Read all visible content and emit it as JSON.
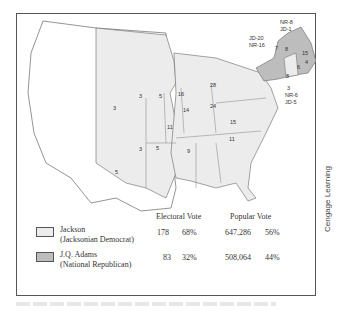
{
  "map": {
    "colors": {
      "jackson": "#ececec",
      "adams": "#bdbdbd",
      "territory": "#ffffff",
      "border": "#666666"
    },
    "state_labels": [
      {
        "text": "3",
        "x": 139,
        "y": 98
      },
      {
        "text": "5",
        "x": 159,
        "y": 98
      },
      {
        "text": "16",
        "x": 178,
        "y": 96
      },
      {
        "text": "28",
        "x": 210,
        "y": 87
      },
      {
        "text": "3",
        "x": 113,
        "y": 110
      },
      {
        "text": "14",
        "x": 183,
        "y": 112
      },
      {
        "text": "24",
        "x": 210,
        "y": 108
      },
      {
        "text": "15",
        "x": 230,
        "y": 124
      },
      {
        "text": "11",
        "x": 167,
        "y": 129
      },
      {
        "text": "11",
        "x": 229,
        "y": 141
      },
      {
        "text": "3",
        "x": 139,
        "y": 151
      },
      {
        "text": "5",
        "x": 156,
        "y": 150
      },
      {
        "text": "9",
        "x": 187,
        "y": 153
      },
      {
        "text": "5",
        "x": 115,
        "y": 174
      },
      {
        "text": "7",
        "x": 275,
        "y": 50
      },
      {
        "text": "8",
        "x": 285,
        "y": 51
      }
    ],
    "callouts": [
      {
        "text": "NR-8",
        "x": 280,
        "y": 24
      },
      {
        "text": "JD-1",
        "x": 280,
        "y": 31
      },
      {
        "text": "JD-20",
        "x": 249,
        "y": 40
      },
      {
        "text": "NR-16",
        "x": 249,
        "y": 47
      },
      {
        "text": "15",
        "x": 302,
        "y": 55
      },
      {
        "text": "4",
        "x": 305,
        "y": 64
      },
      {
        "text": "6",
        "x": 297,
        "y": 69
      },
      {
        "text": "8",
        "x": 286,
        "y": 78
      },
      {
        "text": "3",
        "x": 287,
        "y": 90
      },
      {
        "text": "NR-6",
        "x": 285,
        "y": 97
      },
      {
        "text": "JD-5",
        "x": 285,
        "y": 104
      }
    ]
  },
  "legend": {
    "headers": {
      "electoral": "Electoral Vote",
      "popular": "Popular Vote"
    },
    "rows": [
      {
        "name": "Jackson",
        "party": "(Jacksonian Democrat)",
        "ev": "178",
        "ev_pct": "68%",
        "pv": "647,286",
        "pv_pct": "56%",
        "color": "#ececec"
      },
      {
        "name": "J.Q. Adams",
        "party": "(National Republican)",
        "ev": "83",
        "ev_pct": "32%",
        "pv": "508,064",
        "pv_pct": "44%",
        "color": "#bdbdbd"
      }
    ]
  },
  "credit": "Cengage Learning"
}
